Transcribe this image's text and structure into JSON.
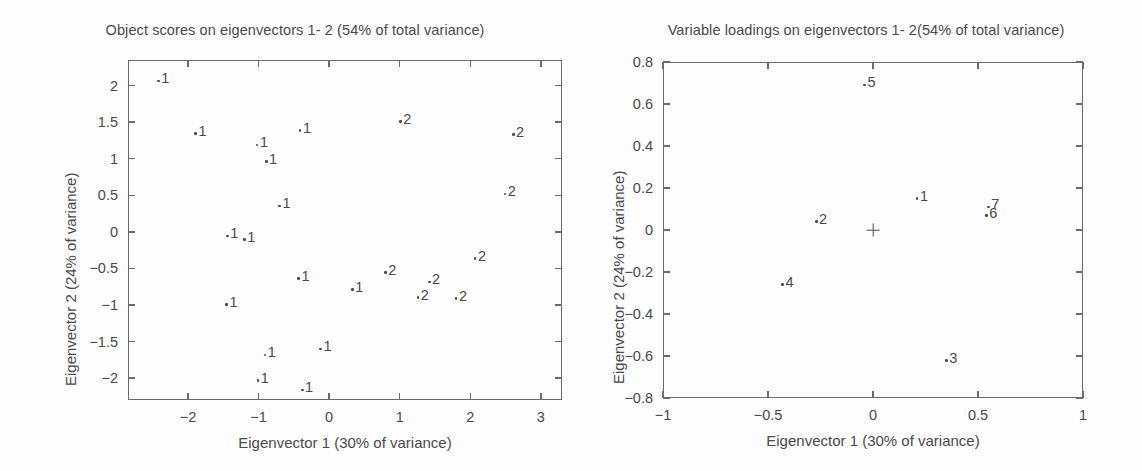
{
  "figure": {
    "background": "#fdfdfd",
    "ink_color": "#4a4a4a",
    "frame_color": "#6b6b6b"
  },
  "chart_data": [
    {
      "type": "scatter",
      "panel": "left",
      "title": "Object scores on eigenvectors 1- 2 (54% of total variance)",
      "xlabel": "Eigenvector 1 (30% of variance)",
      "ylabel": "Eigenvector 2 (24% of variance)",
      "xlim": [
        -2.85,
        3.3
      ],
      "ylim": [
        -2.3,
        2.35
      ],
      "xticks": [
        -2,
        -1,
        0,
        1,
        2,
        3
      ],
      "xticklabels": [
        "−2",
        "−1",
        "0",
        "1",
        "2",
        "3"
      ],
      "yticks": [
        -2,
        -1.5,
        -1,
        -0.5,
        0,
        0.5,
        1,
        1.5,
        2
      ],
      "yticklabels": [
        "−2",
        "−1.5",
        "−1",
        "−0.5",
        "0",
        "0.5",
        "1",
        "1.5",
        "2"
      ],
      "grid": false,
      "legend": "none",
      "marker": "dot-with-group-label",
      "series": [
        {
          "name": "Group 1",
          "label": "1",
          "points": [
            {
              "x": -2.42,
              "y": 2.18,
              "label": "1"
            },
            {
              "x": -1.89,
              "y": 1.46,
              "label": "1"
            },
            {
              "x": -1.02,
              "y": 1.3,
              "label": "1"
            },
            {
              "x": -0.89,
              "y": 1.08,
              "label": "1"
            },
            {
              "x": -0.7,
              "y": 0.47,
              "label": "1"
            },
            {
              "x": -0.41,
              "y": 1.5,
              "label": "1"
            },
            {
              "x": -1.44,
              "y": 0.06,
              "label": "1"
            },
            {
              "x": -1.2,
              "y": 0.01,
              "label": "1"
            },
            {
              "x": -1.45,
              "y": -0.88,
              "label": "1"
            },
            {
              "x": -0.43,
              "y": -0.52,
              "label": "1"
            },
            {
              "x": 0.33,
              "y": -0.67,
              "label": "1"
            },
            {
              "x": -0.91,
              "y": -1.57,
              "label": "1"
            },
            {
              "x": -0.12,
              "y": -1.49,
              "label": "1"
            },
            {
              "x": -1.01,
              "y": -1.92,
              "label": "1"
            },
            {
              "x": -0.38,
              "y": -2.05,
              "label": "1"
            }
          ]
        },
        {
          "name": "Group 2",
          "label": "2",
          "points": [
            {
              "x": 1.01,
              "y": 1.62,
              "label": "2"
            },
            {
              "x": 2.61,
              "y": 1.45,
              "label": "2"
            },
            {
              "x": 2.49,
              "y": 0.63,
              "label": "2"
            },
            {
              "x": 2.07,
              "y": -0.25,
              "label": "2"
            },
            {
              "x": 0.8,
              "y": -0.44,
              "label": "2"
            },
            {
              "x": 1.42,
              "y": -0.57,
              "label": "2"
            },
            {
              "x": 1.26,
              "y": -0.78,
              "label": "2"
            },
            {
              "x": 1.8,
              "y": -0.8,
              "label": "2"
            }
          ]
        }
      ]
    },
    {
      "type": "scatter",
      "panel": "right",
      "title": "Variable loadings on eigenvectors 1- 2(54% of total variance)",
      "xlabel": "Eigenvector 1 (30% of variance)",
      "ylabel": "Eigenvector 2 (24% of variance)",
      "xlim": [
        -1,
        1
      ],
      "ylim": [
        -0.8,
        0.8
      ],
      "xticks": [
        -1,
        -0.5,
        0,
        0.5,
        1
      ],
      "xticklabels": [
        "−1",
        "−0.5",
        "0",
        "0.5",
        "1"
      ],
      "yticks": [
        -0.8,
        -0.6,
        -0.4,
        -0.2,
        0,
        0.2,
        0.4,
        0.6,
        0.8
      ],
      "yticklabels": [
        "−0.8",
        "−0.6",
        "−0.4",
        "−0.2",
        "0",
        "0.2",
        "0.4",
        "0.6",
        "0.8"
      ],
      "grid": false,
      "legend": "none",
      "marker": "dot-with-variable-label",
      "origin_marker": {
        "x": 0,
        "y": 0,
        "symbol": "+"
      },
      "points": [
        {
          "x": -0.04,
          "y": 0.73,
          "label": "5"
        },
        {
          "x": 0.21,
          "y": 0.19,
          "label": "1"
        },
        {
          "x": 0.55,
          "y": 0.15,
          "label": "7"
        },
        {
          "x": 0.54,
          "y": 0.11,
          "label": "6"
        },
        {
          "x": -0.27,
          "y": 0.08,
          "label": "2"
        },
        {
          "x": -0.43,
          "y": -0.22,
          "label": "4"
        },
        {
          "x": 0.35,
          "y": -0.58,
          "label": "3"
        }
      ]
    }
  ]
}
